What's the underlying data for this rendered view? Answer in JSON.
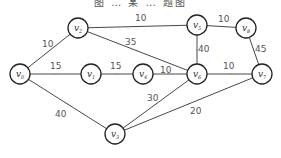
{
  "caption": "图 … 某 … 题图",
  "nodes": [
    {
      "id": "v0",
      "sub": "0",
      "x": 20,
      "y": 74
    },
    {
      "id": "v1",
      "sub": "1",
      "x": 91,
      "y": 74
    },
    {
      "id": "v2",
      "sub": "2",
      "x": 78,
      "y": 28
    },
    {
      "id": "v3",
      "sub": "3",
      "x": 115,
      "y": 134
    },
    {
      "id": "v4",
      "sub": "4",
      "x": 143,
      "y": 74
    },
    {
      "id": "v5",
      "sub": "5",
      "x": 197,
      "y": 25
    },
    {
      "id": "v6",
      "sub": "6",
      "x": 197,
      "y": 74
    },
    {
      "id": "v7",
      "sub": "7",
      "x": 262,
      "y": 74
    },
    {
      "id": "v8",
      "sub": "8",
      "x": 246,
      "y": 28
    }
  ],
  "edges": [
    {
      "from": "v0",
      "to": "v2",
      "weight": "10",
      "lx": 42,
      "ly": 47
    },
    {
      "from": "v0",
      "to": "v1",
      "weight": "15",
      "lx": 50,
      "ly": 69
    },
    {
      "from": "v0",
      "to": "v3",
      "weight": "40",
      "lx": 55,
      "ly": 117
    },
    {
      "from": "v2",
      "to": "v5",
      "weight": "10",
      "lx": 135,
      "ly": 21
    },
    {
      "from": "v2",
      "to": "v6",
      "weight": "35",
      "lx": 125,
      "ly": 45
    },
    {
      "from": "v1",
      "to": "v4",
      "weight": "15",
      "lx": 110,
      "ly": 69
    },
    {
      "from": "v4",
      "to": "v6",
      "weight": "10",
      "lx": 160,
      "ly": 73
    },
    {
      "from": "v6",
      "to": "v5",
      "weight": "40",
      "lx": 198,
      "ly": 52
    },
    {
      "from": "v5",
      "to": "v8",
      "weight": "10",
      "lx": 218,
      "ly": 22
    },
    {
      "from": "v6",
      "to": "v7",
      "weight": "10",
      "lx": 223,
      "ly": 69
    },
    {
      "from": "v7",
      "to": "v8",
      "weight": "45",
      "lx": 255,
      "ly": 52
    },
    {
      "from": "v3",
      "to": "v6",
      "weight": "30",
      "lx": 147,
      "ly": 101
    },
    {
      "from": "v3",
      "to": "v7",
      "weight": "20",
      "lx": 190,
      "ly": 114
    }
  ]
}
